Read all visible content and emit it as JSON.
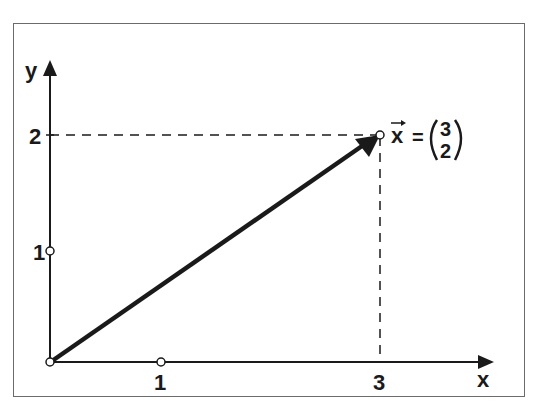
{
  "diagram": {
    "type": "vector-plot",
    "axes": {
      "x_label": "x",
      "y_label": "y",
      "x_ticks": [
        {
          "value": 1,
          "label": "1"
        },
        {
          "value": 3,
          "label": "3"
        }
      ],
      "y_ticks": [
        {
          "value": 1,
          "label": "1"
        },
        {
          "value": 2,
          "label": "2"
        }
      ]
    },
    "vector": {
      "name": "x",
      "from": [
        0,
        0
      ],
      "to": [
        3,
        2
      ],
      "equation_lhs": "x",
      "equals": "=",
      "components": [
        "3",
        "2"
      ]
    },
    "guides": "dashed projection lines from (3,2) to each axis",
    "colors": {
      "ink": "#1a1a1a",
      "frame": "#6b6b6b",
      "background": "#ffffff"
    }
  }
}
